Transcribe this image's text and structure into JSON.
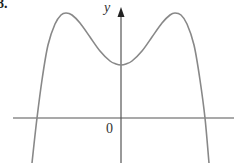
{
  "figure": {
    "number_label": "8.",
    "y_axis_label": "y",
    "origin_label": "0"
  },
  "chart_data": {
    "type": "line",
    "title": "",
    "xlabel": "",
    "ylabel": "y",
    "grid": false,
    "legend": null,
    "axes": {
      "origin": "0",
      "x_ticks": [],
      "y_ticks": []
    },
    "key_points_pixel": {
      "local_max_left": [
        66,
        13
      ],
      "local_min": [
        121,
        65
      ],
      "local_max_right": [
        175,
        13
      ],
      "x_intercepts": [
        [
          37,
          118
        ],
        [
          205,
          118
        ]
      ]
    },
    "series": [
      {
        "name": "f(x)",
        "color": "#888888",
        "points_pixel": [
          [
            32,
            163
          ],
          [
            37,
            118
          ],
          [
            42,
            80
          ],
          [
            48,
            45
          ],
          [
            55,
            24
          ],
          [
            61,
            15
          ],
          [
            66,
            13
          ],
          [
            72,
            15
          ],
          [
            80,
            23
          ],
          [
            90,
            37
          ],
          [
            100,
            51
          ],
          [
            110,
            61
          ],
          [
            116,
            64
          ],
          [
            121,
            65
          ],
          [
            126,
            64
          ],
          [
            132,
            61
          ],
          [
            142,
            51
          ],
          [
            152,
            37
          ],
          [
            162,
            23
          ],
          [
            170,
            15
          ],
          [
            175,
            13
          ],
          [
            181,
            15
          ],
          [
            187,
            24
          ],
          [
            194,
            45
          ],
          [
            200,
            80
          ],
          [
            205,
            118
          ],
          [
            209,
            163
          ]
        ]
      }
    ]
  }
}
